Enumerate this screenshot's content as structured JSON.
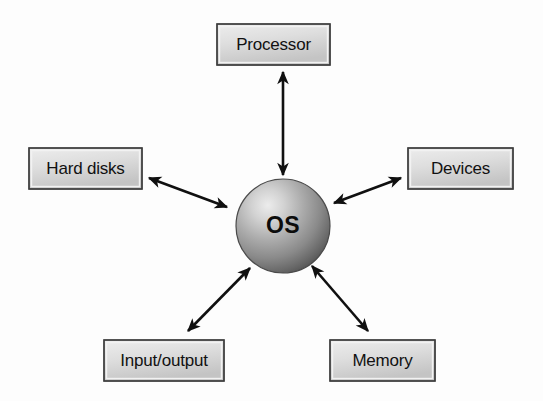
{
  "diagram": {
    "type": "hub-and-spoke",
    "background_color": "#fdfdfd",
    "center": {
      "label": "OS",
      "shape": "sphere",
      "name": "os-sphere",
      "cx": 283,
      "cy": 226,
      "r": 47,
      "highlight_color": "#e8e8e8",
      "mid_color": "#a8a8a8",
      "shadow_color": "#4f4f4f"
    },
    "box_style": {
      "fill_top": "#e9e9e9",
      "fill_bottom": "#c9c9c9",
      "border_color": "#3d3d3d",
      "text_color": "#111111"
    },
    "arrow_color": "#101010",
    "nodes": [
      {
        "id": "processor",
        "label": "Processor",
        "name": "node-processor",
        "x": 217,
        "y": 24,
        "w": 113,
        "h": 41,
        "position": "top"
      },
      {
        "id": "hard-disks",
        "label": "Hard disks",
        "name": "node-hard-disks",
        "x": 29,
        "y": 148,
        "w": 113,
        "h": 41,
        "position": "left"
      },
      {
        "id": "devices",
        "label": "Devices",
        "name": "node-devices",
        "x": 408,
        "y": 148,
        "w": 105,
        "h": 41,
        "position": "right"
      },
      {
        "id": "input-output",
        "label": "Input/output",
        "name": "node-input-output",
        "x": 104,
        "y": 340,
        "w": 120,
        "h": 41,
        "position": "bottom-left"
      },
      {
        "id": "memory",
        "label": "Memory",
        "name": "node-memory",
        "x": 330,
        "y": 340,
        "w": 105,
        "h": 41,
        "position": "bottom-right"
      }
    ],
    "connectors": [
      {
        "id": "os-processor",
        "name": "arrow-os-processor",
        "from": "os",
        "to": "processor",
        "double_headed": true,
        "x1": 283,
        "y1": 175,
        "x2": 283,
        "y2": 72
      },
      {
        "id": "os-hard-disks",
        "name": "arrow-os-hard-disks",
        "from": "os",
        "to": "hard-disks",
        "double_headed": true,
        "x1": 227,
        "y1": 207,
        "x2": 149,
        "y2": 178
      },
      {
        "id": "os-devices",
        "name": "arrow-os-devices",
        "from": "os",
        "to": "devices",
        "double_headed": true,
        "x1": 334,
        "y1": 203,
        "x2": 401,
        "y2": 178
      },
      {
        "id": "os-input-output",
        "name": "arrow-os-input-output",
        "from": "os",
        "to": "input-output",
        "double_headed": true,
        "x1": 250,
        "y1": 268,
        "x2": 188,
        "y2": 331
      },
      {
        "id": "os-memory",
        "name": "arrow-os-memory",
        "from": "os",
        "to": "memory",
        "double_headed": true,
        "x1": 312,
        "y1": 266,
        "x2": 368,
        "y2": 331
      }
    ]
  }
}
